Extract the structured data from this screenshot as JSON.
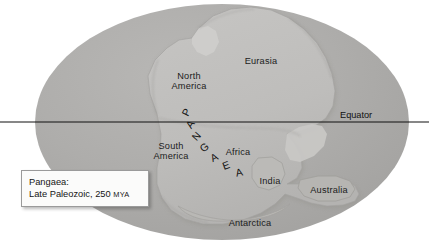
{
  "figure": {
    "kind": "paleogeographic-map",
    "projection": "elliptical",
    "colors": {
      "background": "#ffffff",
      "ocean": "#abaaa9",
      "ocean_highlight": "#b9b8b6",
      "land": "#c0bfbd",
      "land_shadow": "#9d9c9a",
      "land_edge": "#8e8d8b",
      "equator_line": "#111111",
      "label_text": "#1b1b1b",
      "caption_fill": "#fbfbfa",
      "caption_border": "#9a9a9a"
    }
  },
  "equator": {
    "label": "Equator"
  },
  "continents": [
    {
      "id": "north-america",
      "label": "North\nAmerica"
    },
    {
      "id": "eurasia",
      "label": "Eurasia"
    },
    {
      "id": "south-america",
      "label": "South\nAmerica"
    },
    {
      "id": "africa",
      "label": "Africa"
    },
    {
      "id": "india",
      "label": "India"
    },
    {
      "id": "australia",
      "label": "Australia"
    },
    {
      "id": "antarctica",
      "label": "Antarctica"
    }
  ],
  "supercontinent": {
    "name": "PANGAEA",
    "letters": [
      {
        "char": "P",
        "x": 186,
        "y": 112,
        "rot": -64
      },
      {
        "char": "A",
        "x": 190,
        "y": 124,
        "rot": -56
      },
      {
        "char": "N",
        "x": 196,
        "y": 136,
        "rot": -48
      },
      {
        "char": "G",
        "x": 204,
        "y": 147,
        "rot": -38
      },
      {
        "char": "A",
        "x": 214,
        "y": 157,
        "rot": -28
      },
      {
        "char": "E",
        "x": 226,
        "y": 165,
        "rot": -20
      },
      {
        "char": "A",
        "x": 239,
        "y": 172,
        "rot": -13
      }
    ]
  },
  "caption": {
    "line1": "Pangaea:",
    "line2_main": "Late Paleozoic, 250 ",
    "line2_unit": "MYA"
  }
}
